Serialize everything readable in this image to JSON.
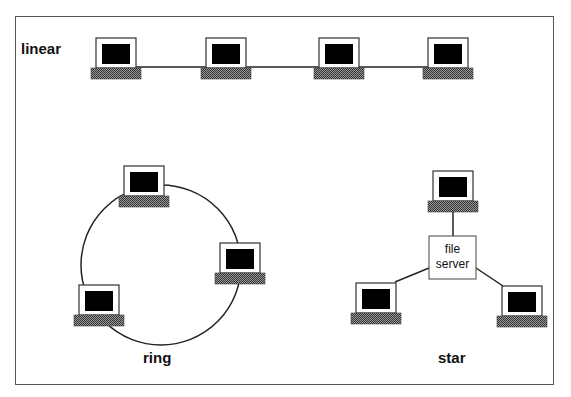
{
  "diagram": {
    "topologies": [
      {
        "name": "linear",
        "label": "linear",
        "nodes": 4
      },
      {
        "name": "ring",
        "label": "ring",
        "nodes": 3
      },
      {
        "name": "star",
        "label": "star",
        "nodes": 3,
        "center": "file server"
      }
    ],
    "labels": {
      "linear": "linear",
      "ring": "ring",
      "star": "star",
      "file_server_line1": "file",
      "file_server_line2": "server"
    },
    "colors": {
      "screen": "#000000",
      "monitor_border": "#333333",
      "base": "#6e6e6e",
      "line": "#222222",
      "frame": "#555555"
    }
  }
}
